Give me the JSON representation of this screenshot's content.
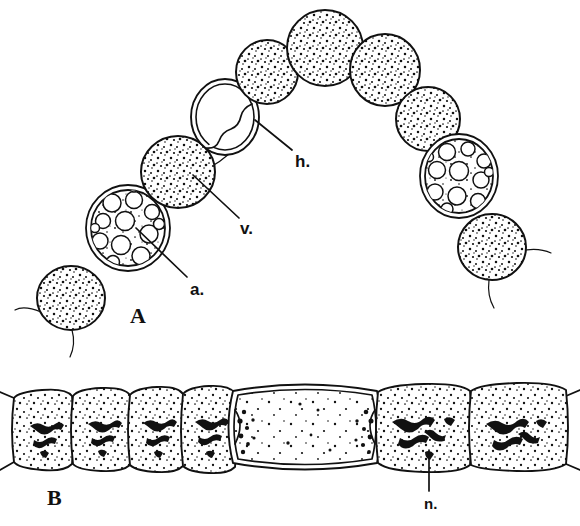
{
  "figure": {
    "background_color": "#ffffff",
    "ink_color": "#111111",
    "style": "black-and-white line drawing, stippled shading"
  },
  "panels": [
    {
      "id": "A",
      "label": "A",
      "label_position": {
        "x": 130,
        "y": 305
      },
      "description": "Arc-shaped chain of spherical algal cells; most cells densely stippled, two cells vacuolated with large clear vacuoles, one cell empty/hollow with double wall",
      "cell_count": 11
    },
    {
      "id": "B",
      "label": "B",
      "label_position": {
        "x": 47,
        "y": 487
      },
      "description": "Horizontal filament of barrel-shaped cells with stippled cytoplasm and dark nuclear material; one large enlarged empty cell (heterocyst) near the centre",
      "cell_count": 7
    }
  ],
  "annotations": [
    {
      "key": "a",
      "label": "a.",
      "panel": "A",
      "meaning": "vacuolated-cell-pointer",
      "label_position": {
        "x": 190,
        "y": 281
      },
      "leader_from": {
        "x": 187,
        "y": 277
      },
      "leader_to": {
        "x": 136,
        "y": 228
      }
    },
    {
      "key": "v",
      "label": "v.",
      "panel": "A",
      "meaning": "stippled-cell-pointer",
      "label_position": {
        "x": 240,
        "y": 220
      },
      "leader_from": {
        "x": 239,
        "y": 218
      },
      "leader_to": {
        "x": 193,
        "y": 175
      }
    },
    {
      "key": "h",
      "label": "h.",
      "panel": "A",
      "meaning": "hollow-cell-pointer",
      "label_position": {
        "x": 295,
        "y": 153
      },
      "leader_from": {
        "x": 292,
        "y": 150
      },
      "leader_to": {
        "x": 255,
        "y": 120
      }
    },
    {
      "key": "n",
      "label": "n.",
      "panel": "B",
      "meaning": "nucleus-pointer",
      "label_position": {
        "x": 424,
        "y": 496
      },
      "leader_from": {
        "x": 429,
        "y": 491
      },
      "leader_to": {
        "x": 429,
        "y": 450
      }
    }
  ],
  "panel_a_cells": [
    {
      "name": "cell-1-stippled",
      "type": "stippled",
      "cx": 71,
      "cy": 298,
      "rx": 34,
      "ry": 32,
      "rot": -8
    },
    {
      "name": "cell-2-vacuolate",
      "type": "vacuolated",
      "cx": 128,
      "cy": 228,
      "rx": 42,
      "ry": 43,
      "rot": -14
    },
    {
      "name": "cell-3-stippled",
      "type": "stippled",
      "cx": 178,
      "cy": 172,
      "rx": 37,
      "ry": 36,
      "rot": 6
    },
    {
      "name": "cell-4-hollow",
      "type": "hollow",
      "cx": 225,
      "cy": 117,
      "rx": 34,
      "ry": 38,
      "rot": 4
    },
    {
      "name": "cell-5-stippled",
      "type": "stippled",
      "cx": 267,
      "cy": 72,
      "rx": 31,
      "ry": 32,
      "rot": 0
    },
    {
      "name": "cell-6-stippled",
      "type": "stippled",
      "cx": 325,
      "cy": 48,
      "rx": 38,
      "ry": 38,
      "rot": 0
    },
    {
      "name": "cell-7-stippled",
      "type": "stippled",
      "cx": 385,
      "cy": 70,
      "rx": 35,
      "ry": 36,
      "rot": 0
    },
    {
      "name": "cell-8-stippled",
      "type": "stippled",
      "cx": 428,
      "cy": 119,
      "rx": 32,
      "ry": 32,
      "rot": 0
    },
    {
      "name": "cell-9-vacuolate",
      "type": "vacuolated",
      "cx": 459,
      "cy": 176,
      "rx": 39,
      "ry": 42,
      "rot": 10
    },
    {
      "name": "cell-10-stippled",
      "type": "stippled",
      "cx": 492,
      "cy": 247,
      "rx": 34,
      "ry": 33,
      "rot": 0
    }
  ],
  "panel_b_cells": [
    {
      "name": "cell-b1",
      "type": "stippled-nucleus",
      "x": 13,
      "w": 60,
      "nucleus": true
    },
    {
      "name": "cell-b2",
      "type": "stippled-nucleus",
      "x": 73,
      "w": 57,
      "nucleus": true
    },
    {
      "name": "cell-b3",
      "type": "stippled-nucleus",
      "x": 130,
      "w": 53,
      "nucleus": true
    },
    {
      "name": "cell-b4",
      "type": "stippled-nucleus",
      "x": 183,
      "w": 52,
      "nucleus": true
    },
    {
      "name": "cell-b5-heterocyst",
      "type": "enlarged-empty",
      "x": 232,
      "w": 146,
      "nucleus": false
    },
    {
      "name": "cell-b6",
      "type": "stippled-nucleus",
      "x": 378,
      "w": 93,
      "nucleus": true
    },
    {
      "name": "cell-b7",
      "type": "stippled-nucleus",
      "x": 471,
      "w": 93,
      "nucleus": true
    }
  ]
}
